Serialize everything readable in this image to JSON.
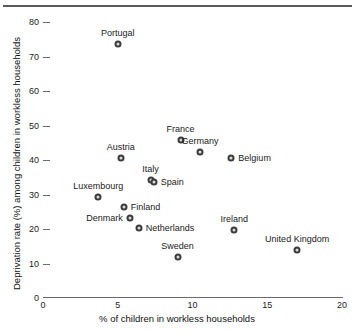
{
  "chart_data": {
    "type": "scatter",
    "title": "",
    "xlabel": "% of children in workless households",
    "ylabel": "Deprivation rate (%) among children in workless households",
    "xlim": [
      0,
      20
    ],
    "ylim": [
      0,
      80
    ],
    "xticks": [
      "0",
      "5",
      "10",
      "15",
      "20"
    ],
    "yticks": [
      "0",
      "10",
      "20",
      "30",
      "40",
      "50",
      "60",
      "70",
      "80"
    ],
    "grid": false,
    "legend": "none",
    "points": [
      {
        "name": "Portugal",
        "x": 5.0,
        "y": 73.5,
        "label_pos": "above"
      },
      {
        "name": "France",
        "x": 9.2,
        "y": 45.8,
        "label_pos": "above"
      },
      {
        "name": "Germany",
        "x": 10.5,
        "y": 42.3,
        "label_pos": "above"
      },
      {
        "name": "Belgium",
        "x": 12.6,
        "y": 40.6,
        "label_pos": "right"
      },
      {
        "name": "Austria",
        "x": 5.2,
        "y": 40.6,
        "label_pos": "above"
      },
      {
        "name": "Italy",
        "x": 7.2,
        "y": 34.2,
        "label_pos": "above"
      },
      {
        "name": "Spain",
        "x": 7.4,
        "y": 33.6,
        "label_pos": "right"
      },
      {
        "name": "Luxembourg",
        "x": 3.7,
        "y": 29.3,
        "label_pos": "above"
      },
      {
        "name": "Finland",
        "x": 5.4,
        "y": 26.3,
        "label_pos": "right"
      },
      {
        "name": "Denmark",
        "x": 5.8,
        "y": 23.2,
        "label_pos": "left"
      },
      {
        "name": "Netherlands",
        "x": 6.4,
        "y": 20.3,
        "label_pos": "right"
      },
      {
        "name": "Sweden",
        "x": 9.0,
        "y": 11.9,
        "label_pos": "above"
      },
      {
        "name": "Ireland",
        "x": 12.8,
        "y": 19.8,
        "label_pos": "above"
      },
      {
        "name": "United Kingdom",
        "x": 17.0,
        "y": 13.8,
        "label_pos": "above"
      }
    ],
    "colors": {
      "marker_edge": "#3b3b3b",
      "marker_fill": "#d9d9d9",
      "axis": "#6b6b6b",
      "text": "#1a1a1a"
    }
  }
}
